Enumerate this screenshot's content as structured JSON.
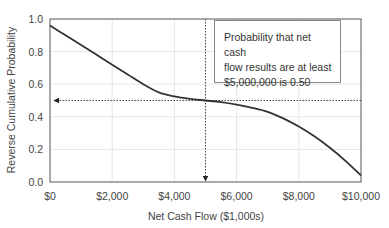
{
  "chart_data": {
    "type": "line",
    "title": "",
    "xlabel": "Net Cash Flow ($1,000s)",
    "ylabel": "Reverse Cumulative Probability",
    "xlim": [
      0,
      10000
    ],
    "ylim": [
      0,
      1.0
    ],
    "grid": true,
    "x_ticks": [
      "$0",
      "$2,000",
      "$4,000",
      "$6,000",
      "$8,000",
      "$10,000"
    ],
    "x_tick_values": [
      0,
      2000,
      4000,
      6000,
      8000,
      10000
    ],
    "y_ticks": [
      "0.0",
      "0.2",
      "0.4",
      "0.6",
      "0.8",
      "1.0"
    ],
    "y_tick_values": [
      0,
      0.2,
      0.4,
      0.6,
      0.8,
      1.0
    ],
    "series": [
      {
        "name": "Reverse Cumulative Probability",
        "x": [
          0,
          500,
          1000,
          1500,
          2000,
          2500,
          3000,
          3500,
          4000,
          4500,
          5000,
          5500,
          6000,
          6500,
          7000,
          7500,
          8000,
          8500,
          9000,
          9500,
          10000
        ],
        "values": [
          0.96,
          0.9,
          0.84,
          0.78,
          0.72,
          0.66,
          0.6,
          0.55,
          0.525,
          0.51,
          0.5,
          0.49,
          0.475,
          0.455,
          0.43,
          0.39,
          0.34,
          0.28,
          0.21,
          0.13,
          0.04
        ]
      }
    ],
    "annotations": [
      {
        "type": "vertical-dotted-arrow",
        "x": 5000,
        "from_y": 1.0,
        "to_y": 0.0
      },
      {
        "type": "horizontal-dotted-arrow",
        "y": 0.5,
        "from_x": 10000,
        "to_x": 0
      },
      {
        "type": "text-box",
        "text": "Probability that net cash flow results are at least $5,000,000 is 0.50"
      }
    ]
  },
  "annotation": {
    "line1": "Probability that net cash",
    "line2": "flow results are at least",
    "line3": "$5,000,000 is 0.50"
  },
  "colors": {
    "curve": "#333333",
    "grid": "#e6e6e6",
    "axis": "#555555",
    "text": "#444444"
  }
}
